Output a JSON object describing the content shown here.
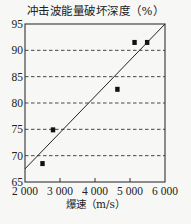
{
  "chart_data": {
    "type": "scatter",
    "title": "冲击波能量破坏深度（%）",
    "xlabel": "爆速（m/s）",
    "ylabel": "冲击波能量破坏深度（%）",
    "xlim": [
      2000,
      6000
    ],
    "ylim": [
      65,
      95
    ],
    "x_ticks": [
      2000,
      3000,
      4000,
      5000,
      6000
    ],
    "x_tick_labels": [
      "2 000",
      "3 000",
      "4 000",
      "5 000",
      "6 000"
    ],
    "y_ticks": [
      65,
      70,
      75,
      80,
      85,
      90,
      95
    ],
    "y_tick_labels": [
      "65",
      "70",
      "75",
      "80",
      "85",
      "90",
      "95"
    ],
    "grid": {
      "horizontal": "dashed",
      "values": [
        70,
        75,
        80,
        85,
        90
      ],
      "vertical": false
    },
    "series": [
      {
        "name": "实测数据",
        "marker": "square",
        "points": [
          {
            "x": 2500,
            "y": 68.5
          },
          {
            "x": 2800,
            "y": 74.9
          },
          {
            "x": 4640,
            "y": 82.6
          },
          {
            "x": 5130,
            "y": 91.5
          },
          {
            "x": 5490,
            "y": 91.5
          }
        ]
      },
      {
        "name": "拟合直线",
        "type": "line",
        "points": [
          {
            "x": 2000,
            "y": 67.5
          },
          {
            "x": 6000,
            "y": 95
          }
        ]
      }
    ],
    "legend": "none"
  },
  "caption": "图 冲击波能量破坏深度"
}
